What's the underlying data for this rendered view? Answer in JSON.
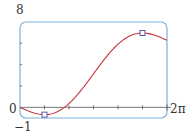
{
  "chart_data": {
    "type": "line",
    "title": "",
    "function": "y = x - 2 sin x",
    "xlabel": "",
    "ylabel": "",
    "xlim": [
      0,
      6.2832
    ],
    "ylim": [
      -1,
      8
    ],
    "x_tick_labels": {
      "right": "2π"
    },
    "y_tick_labels": {
      "top": "8",
      "zero": "0",
      "bottom": "-1"
    },
    "x_ticks": [
      1.0472,
      2.0944,
      3.1416,
      4.1888,
      5.236
    ],
    "y_ticks": [
      2,
      4,
      6
    ],
    "grid": false,
    "series": [
      {
        "name": "curve",
        "color": "#c8323c",
        "x": [
          0,
          0.5236,
          1.0472,
          1.5708,
          2.0944,
          2.618,
          3.1416,
          3.6652,
          4.1888,
          4.7124,
          5.236,
          5.7596,
          6.2832
        ],
        "y": [
          0,
          -0.476,
          -0.685,
          -0.429,
          0.362,
          1.618,
          3.142,
          4.665,
          5.921,
          6.712,
          6.968,
          6.76,
          6.283
        ]
      }
    ],
    "markers": [
      {
        "label": "local minimum",
        "x": 1.0472,
        "y": -0.685
      },
      {
        "label": "local maximum",
        "x": 5.236,
        "y": 6.968
      }
    ]
  },
  "labels": {
    "ymax": "8",
    "zero": "0",
    "ymin": "−1",
    "xmax": "2π"
  },
  "colors": {
    "frame": "#7fb0dc",
    "curve": "#c8323c",
    "marker": "#4a4aa0",
    "axis": "#555555"
  }
}
